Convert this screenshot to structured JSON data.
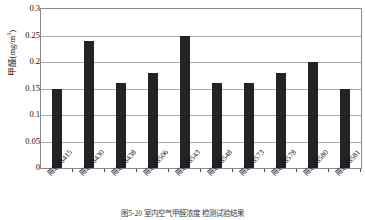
{
  "chart_data": {
    "type": "bar",
    "title": "",
    "subtitle": "",
    "xlabel": "",
    "ylabel": "甲醛(mg/m³)",
    "ylabel_text": "甲醛(mg/m",
    "ylabel_sup": "3",
    "ylabel_tail": ")",
    "categories": [
      "陈CT8415",
      "陈CT8430",
      "陈CT8438",
      "陈CT8506",
      "陈CT8543",
      "陈CT8548",
      "陈CT8573",
      "陈CT8578",
      "陈CT8580",
      "陈CT8581"
    ],
    "values": [
      0.15,
      0.24,
      0.16,
      0.18,
      0.25,
      0.16,
      0.16,
      0.18,
      0.2,
      0.15
    ],
    "ylim": [
      0,
      0.3
    ],
    "ytick_values": [
      0,
      0.05,
      0.1,
      0.15,
      0.2,
      0.25,
      0.3
    ],
    "ytick_labels": [
      "0",
      "0.05",
      "0.1",
      "0.15",
      "0.2",
      "0.25",
      "0.3"
    ],
    "grid": "horizontal",
    "legend": "none",
    "bar_color": "#232323",
    "grid_color": "#a9a9a9",
    "frame_color": "#8a8a8a",
    "background": "#ffffff"
  },
  "caption": {
    "text": "图5-20  室内空气甲醛浓度  检测试验结果"
  }
}
